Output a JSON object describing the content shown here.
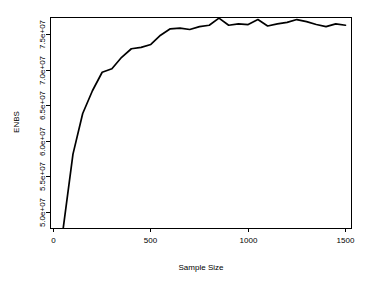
{
  "chart_data": {
    "type": "line",
    "title": "",
    "xlabel": "Sample Size",
    "ylabel": "ENBS",
    "xlim": [
      0,
      1550
    ],
    "ylim": [
      47000000,
      77500000
    ],
    "grid": false,
    "legend": null,
    "xticks": [
      0,
      500,
      1000,
      1500
    ],
    "xticklabels": [
      "0",
      "500",
      "1000",
      "1500"
    ],
    "yticks": [
      50000000,
      55000000,
      60000000,
      65000000,
      70000000,
      75000000
    ],
    "yticklabels": [
      "5.0e+07",
      "5.5e+07",
      "6.0e+07",
      "6.5e+07",
      "7.0e+07",
      "7.5e+07"
    ],
    "series": [
      {
        "name": "ENBS",
        "color": "#000000",
        "x": [
          50,
          100,
          150,
          200,
          250,
          300,
          350,
          400,
          450,
          500,
          550,
          600,
          650,
          700,
          750,
          800,
          850,
          900,
          950,
          1000,
          1050,
          1100,
          1150,
          1200,
          1250,
          1300,
          1350,
          1400,
          1450,
          1500
        ],
        "y": [
          47800000,
          58200000,
          63900000,
          67100000,
          69700000,
          70200000,
          71800000,
          73000000,
          73200000,
          73600000,
          74900000,
          75800000,
          75900000,
          75700000,
          76100000,
          76300000,
          77300000,
          76300000,
          76500000,
          76400000,
          77100000,
          76200000,
          76500000,
          76700000,
          77100000,
          76800000,
          76400000,
          76100000,
          76500000,
          76300000
        ]
      }
    ]
  },
  "axes": {
    "x_title": "Sample Size",
    "y_title": "ENBS"
  }
}
